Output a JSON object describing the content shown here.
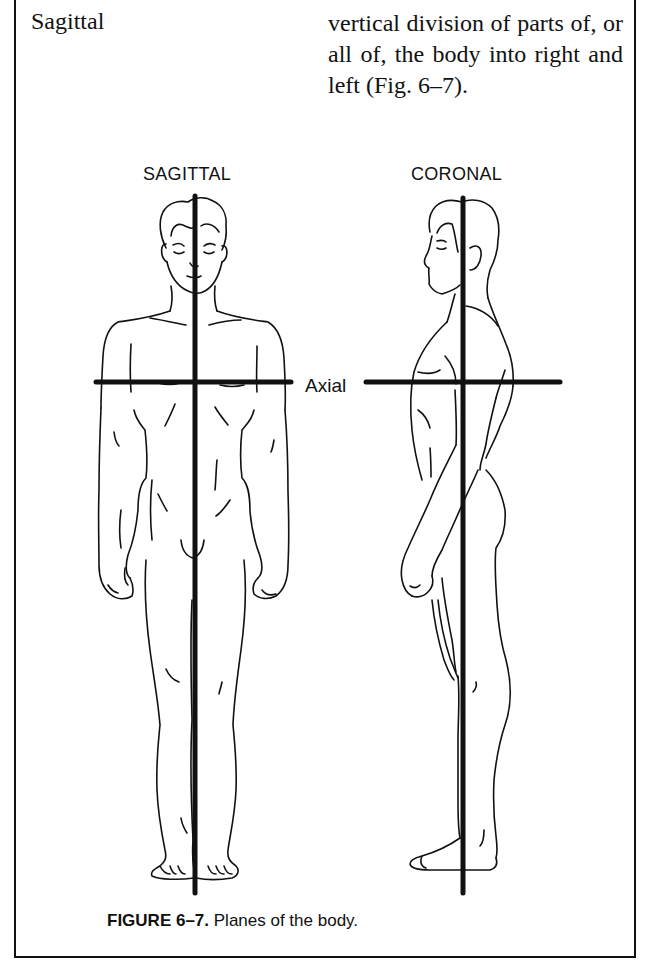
{
  "glossary_entry": {
    "term": "Sagittal",
    "definition": "vertical division of parts of, or all of, the body into right and left (Fig. 6–7)."
  },
  "figure": {
    "labels": {
      "sagittal": "SAGITTAL",
      "coronal": "CORONAL",
      "axial": "Axial"
    },
    "caption": {
      "number": "FIGURE 6–7.",
      "text": " Planes of the body."
    },
    "colors": {
      "ink": "#111111",
      "background": "#ffffff"
    }
  }
}
